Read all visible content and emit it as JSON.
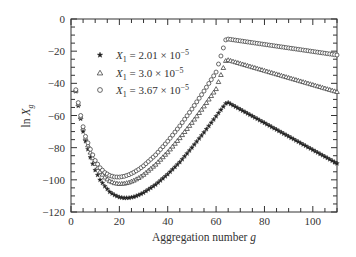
{
  "chart_data": {
    "type": "scatter",
    "title": "",
    "xlabel": "Aggregation number g",
    "ylabel": "ln X_g",
    "xlim": [
      0,
      110
    ],
    "ylim": [
      -120,
      0
    ],
    "xticks": [
      0,
      20,
      40,
      60,
      80,
      100
    ],
    "yticks": [
      0,
      -20,
      -40,
      -60,
      -80,
      -100,
      -120
    ],
    "grid": false,
    "legend_position": "upper-left",
    "series": [
      {
        "name": "X1 = 2.01 × 10^-5",
        "label_main": "X",
        "label_sub": "1",
        "label_value": " = 2.01 × 10",
        "label_exp": "−5",
        "marker": "star",
        "x": [
          2,
          3,
          4,
          5,
          6,
          8,
          10,
          12,
          14,
          16,
          18,
          20,
          22,
          24,
          26,
          28,
          30,
          35,
          40,
          45,
          50,
          55,
          60,
          64,
          65,
          70,
          75,
          80,
          85,
          90,
          95,
          100,
          105,
          110
        ],
        "values": [
          -45,
          -54,
          -62,
          -70,
          -76,
          -86,
          -94,
          -100,
          -104,
          -107.5,
          -109.5,
          -110.8,
          -111.3,
          -111.2,
          -110.6,
          -109.5,
          -108,
          -103,
          -96.5,
          -89,
          -80,
          -70.5,
          -60.5,
          -52.5,
          -52,
          -56.2,
          -60.4,
          -64.6,
          -68.8,
          -73,
          -77.2,
          -81.4,
          -85.6,
          -89.8
        ]
      },
      {
        "name": "X1 = 3.0 × 10^-5",
        "label_main": "X",
        "label_sub": "1",
        "label_value": " = 3.0 × 10",
        "label_exp": "−5",
        "marker": "triangle",
        "x": [
          2,
          3,
          4,
          5,
          6,
          8,
          10,
          12,
          14,
          16,
          18,
          20,
          22,
          24,
          26,
          28,
          30,
          35,
          40,
          45,
          50,
          55,
          60,
          64,
          65,
          70,
          75,
          80,
          85,
          90,
          95,
          100,
          105,
          110
        ],
        "values": [
          -44.5,
          -53,
          -61,
          -68,
          -74,
          -83,
          -90,
          -95,
          -98.5,
          -100.8,
          -102,
          -102.5,
          -102.3,
          -101.6,
          -100.4,
          -98.8,
          -96.8,
          -90.5,
          -82.8,
          -74,
          -64.5,
          -54.3,
          -43.5,
          -26,
          -25.5,
          -27.7,
          -29.9,
          -32.1,
          -34.3,
          -36.5,
          -38.7,
          -40.9,
          -43.1,
          -45.3
        ]
      },
      {
        "name": "X1 = 3.67 × 10^-5",
        "label_main": "X",
        "label_sub": "1",
        "label_value": " = 3.67 × 10",
        "label_exp": "−5",
        "marker": "circle",
        "x": [
          2,
          3,
          4,
          5,
          6,
          8,
          10,
          12,
          14,
          16,
          18,
          20,
          22,
          24,
          26,
          28,
          30,
          35,
          40,
          45,
          50,
          55,
          60,
          64,
          65,
          70,
          75,
          80,
          85,
          90,
          95,
          100,
          105,
          110
        ],
        "values": [
          -44,
          -52,
          -60,
          -67,
          -73,
          -81,
          -88,
          -92.5,
          -95.5,
          -97.3,
          -98.2,
          -98.3,
          -97.8,
          -96.8,
          -95.3,
          -93.5,
          -91.3,
          -84.5,
          -76,
          -66.5,
          -56,
          -44.8,
          -33,
          -13,
          -12.5,
          -13.6,
          -14.7,
          -15.8,
          -16.9,
          -18,
          -19.1,
          -20.2,
          -21.3,
          -22.4
        ]
      }
    ]
  },
  "axes": {
    "x_title_main": "Aggregation number ",
    "x_title_var": "g",
    "y_title_main": "ln ",
    "y_title_var": "X",
    "y_title_sub": "g"
  }
}
